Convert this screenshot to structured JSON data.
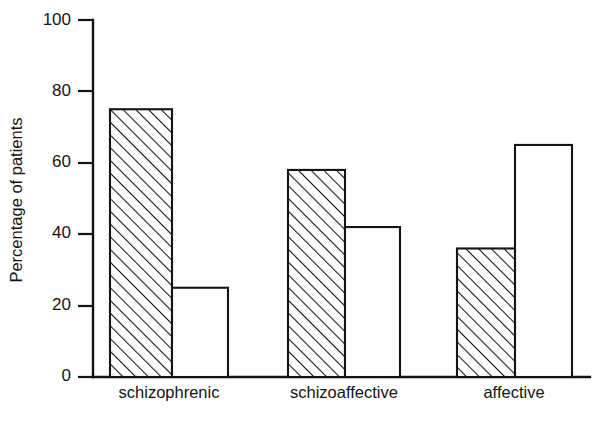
{
  "chart_data": {
    "type": "bar",
    "title": "",
    "subtitle": "",
    "xlabel": "",
    "ylabel": "Percentage of patients",
    "categories": [
      "schizophrenic",
      "schizoaffective",
      "affective"
    ],
    "series": [
      {
        "name": "hatched",
        "pattern": "diagonal-hatch",
        "values": [
          75,
          58,
          36
        ]
      },
      {
        "name": "open",
        "pattern": "solid-white",
        "values": [
          25,
          42,
          65
        ]
      }
    ],
    "ylim": [
      0,
      100
    ],
    "yticks": [
      0,
      20,
      40,
      60,
      80,
      100
    ],
    "ytick_labels": [
      "0",
      "20",
      "40",
      "60",
      "80",
      "100"
    ],
    "grid": false,
    "legend": "none",
    "axis_color": "#141414",
    "bar_fill_open": "#ffffff",
    "bar_stroke": "#141414",
    "background": "#ffffff"
  },
  "figure": {
    "plot": {
      "x_axis_y": 377,
      "y_axis_x": 93,
      "y_top": 20,
      "right_edge": 590
    },
    "bars": [
      {
        "name": "schizophrenic-hatched",
        "x": 110,
        "width": 62,
        "value": 75
      },
      {
        "name": "schizophrenic-open",
        "x": 172,
        "width": 56,
        "value": 25
      },
      {
        "name": "schizoaffective-hatched",
        "x": 288,
        "width": 57,
        "value": 58
      },
      {
        "name": "schizoaffective-open",
        "x": 345,
        "width": 55,
        "value": 42
      },
      {
        "name": "affective-hatched",
        "x": 457,
        "width": 58,
        "value": 36
      },
      {
        "name": "affective-open",
        "x": 515,
        "width": 57,
        "value": 65
      }
    ],
    "category_centers": [
      169,
      344,
      514
    ]
  }
}
